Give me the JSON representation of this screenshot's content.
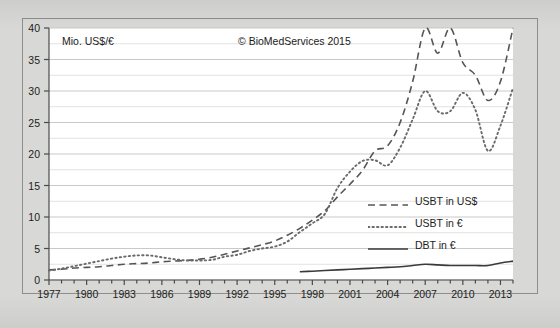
{
  "chart_data": {
    "type": "line",
    "title": "",
    "ylabel": "Mio. US$/€",
    "xlabel": "",
    "annotation": "© BioMedServices 2015",
    "xlim": [
      1977,
      2014
    ],
    "ylim": [
      0,
      40
    ],
    "ytick_step": 5,
    "yminor_step": 2.5,
    "xtick_step": 1,
    "xlabel_step": 3,
    "grid": "horizontal",
    "legend_position": "center-right",
    "x": [
      1977,
      1978,
      1979,
      1980,
      1981,
      1982,
      1983,
      1984,
      1985,
      1986,
      1987,
      1988,
      1989,
      1990,
      1991,
      1992,
      1993,
      1994,
      1995,
      1996,
      1997,
      1998,
      1999,
      2000,
      2001,
      2002,
      2003,
      2004,
      2005,
      2006,
      2007,
      2008,
      2009,
      2010,
      2011,
      2012,
      2013,
      2014
    ],
    "yticks": [
      0,
      5,
      10,
      15,
      20,
      25,
      30,
      35,
      40
    ],
    "xticklabels": [
      "1977",
      "1980",
      "1983",
      "1986",
      "1989",
      "1992",
      "1995",
      "1998",
      "2001",
      "2004",
      "2007",
      "2010",
      "2013"
    ],
    "series": [
      {
        "name": "USBT in US$",
        "style": "dashed",
        "color": "#555553",
        "values": [
          1.6,
          1.7,
          1.9,
          2.0,
          2.1,
          2.3,
          2.5,
          2.6,
          2.7,
          2.9,
          3.0,
          3.1,
          3.3,
          3.6,
          4.1,
          4.6,
          5.1,
          5.6,
          6.2,
          7.1,
          8.2,
          9.5,
          11.0,
          13.2,
          15.2,
          17.4,
          20.5,
          21.3,
          25.0,
          31.5,
          40.0,
          36.0,
          40.0,
          34.5,
          32.5,
          28.5,
          31.5,
          40.0
        ]
      },
      {
        "name": "USBT in €",
        "style": "dotted",
        "color": "#6a6a68",
        "values": [
          1.5,
          1.8,
          2.2,
          2.6,
          3.0,
          3.4,
          3.7,
          3.9,
          3.9,
          3.6,
          3.3,
          3.1,
          3.1,
          3.2,
          3.7,
          4.0,
          4.6,
          5.0,
          5.3,
          6.1,
          7.6,
          9.0,
          10.5,
          14.6,
          17.2,
          18.9,
          19.0,
          18.2,
          21.0,
          25.5,
          30.0,
          26.8,
          26.8,
          29.7,
          27.0,
          20.5,
          24.5,
          30.5
        ]
      },
      {
        "name": "DBT in €",
        "style": "solid",
        "color": "#3a3a38",
        "start_year": 1997,
        "values": [
          null,
          null,
          null,
          null,
          null,
          null,
          null,
          null,
          null,
          null,
          null,
          null,
          null,
          null,
          null,
          null,
          null,
          null,
          null,
          null,
          1.3,
          1.4,
          1.5,
          1.6,
          1.7,
          1.8,
          1.9,
          2.0,
          2.1,
          2.3,
          2.5,
          2.4,
          2.3,
          2.3,
          2.3,
          2.3,
          2.7,
          3.0
        ]
      }
    ]
  },
  "legend": {
    "items": [
      {
        "label": "USBT in US$",
        "style": "dashed"
      },
      {
        "label": "USBT in €",
        "style": "dotted"
      },
      {
        "label": "DBT in €",
        "style": "solid"
      }
    ]
  },
  "colors": {
    "page_background": "#d8d8d6",
    "plot_background": "#ffffff",
    "frame_border": "#8e8e8c",
    "grid_major": "#c9c9c7",
    "grid_minor": "#e2e2e0",
    "axis": "#4a4a48",
    "text": "#1d1d1b"
  }
}
